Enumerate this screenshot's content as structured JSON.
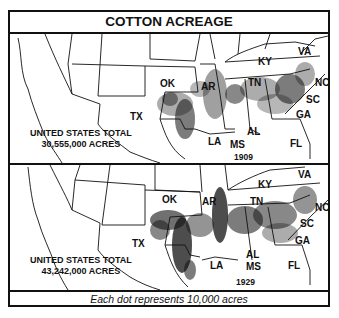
{
  "title": "COTTON ACREAGE",
  "footer": "Each dot represents 10,000 acres",
  "maps": [
    {
      "year": "1909",
      "total_label": "UNITED STATES TOTAL",
      "total_value": "30,555,000 ACRES",
      "states": [
        "OK",
        "AR",
        "KY",
        "TN",
        "VA",
        "NC",
        "SC",
        "GA",
        "FL",
        "AL",
        "MS",
        "LA",
        "TX"
      ]
    },
    {
      "year": "1929",
      "total_label": "UNITED STATES TOTAL",
      "total_value": "43,242,000 ACRES",
      "states": [
        "OK",
        "AR",
        "KY",
        "TN",
        "VA",
        "NC",
        "SC",
        "GA",
        "FL",
        "AL",
        "MS",
        "LA",
        "TX"
      ]
    }
  ],
  "legend": {
    "dot_value": "10,000 acres"
  },
  "colors": {
    "ink": "#111111",
    "background": "#ffffff"
  }
}
